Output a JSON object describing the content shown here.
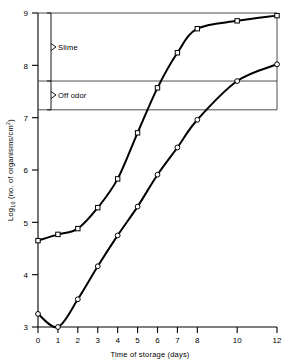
{
  "chart_data": {
    "type": "line",
    "title": "",
    "subtitle": "",
    "xlabel": "Time of storage (days)",
    "ylabel_parts": {
      "main_prefix": "Log",
      "main_subscript": "10",
      "main_suffix": " (no. of organisms/cm",
      "main_superscript": "2",
      "main_close": ")"
    },
    "ylabel": "Log10 (no. of organisms/cm2)",
    "xlim": [
      0,
      12
    ],
    "ylim": [
      3,
      9
    ],
    "grid": false,
    "legend_position": "none",
    "x_tick_values": [
      0,
      1,
      2,
      3,
      4,
      5,
      6,
      7,
      8,
      10,
      12
    ],
    "x_tick_labels": [
      "0",
      "1",
      "2",
      "3",
      "4",
      "5",
      "6",
      "7",
      "8",
      "10",
      "12"
    ],
    "y_tick_values": [
      3,
      4,
      5,
      6,
      7,
      8,
      9
    ],
    "y_tick_labels": [
      "3",
      "4",
      "5",
      "6",
      "7",
      "8",
      "9"
    ],
    "series": [
      {
        "name": "upper-curve",
        "marker": "square-open",
        "x": [
          0,
          1,
          2,
          3,
          4,
          5,
          6,
          7,
          8,
          10,
          12
        ],
        "values": [
          4.65,
          4.77,
          4.88,
          5.28,
          5.83,
          6.71,
          7.57,
          8.24,
          8.7,
          8.85,
          8.95
        ]
      },
      {
        "name": "lower-curve",
        "marker": "circle-open",
        "x": [
          0,
          1,
          2,
          3,
          4,
          5,
          6,
          7,
          8,
          10,
          12
        ],
        "values": [
          3.25,
          3.0,
          3.53,
          4.16,
          4.75,
          5.3,
          5.91,
          6.43,
          6.96,
          7.7,
          8.02
        ]
      }
    ],
    "threshold_lines": [
      {
        "name": "slime-threshold",
        "value": 7.7
      },
      {
        "name": "off-odor-threshold",
        "value": 7.15
      }
    ],
    "annotations": [
      {
        "name": "slime",
        "label": "Slime",
        "y_from": 7.7,
        "y_to": 9.0
      },
      {
        "name": "off-odor",
        "label": "Off  odor",
        "y_from": 7.15,
        "y_to": 7.7
      }
    ],
    "colors": {
      "axis": "#000000",
      "curve": "#000000",
      "threshold": "#3a3a3a",
      "background": "#ffffff"
    }
  }
}
